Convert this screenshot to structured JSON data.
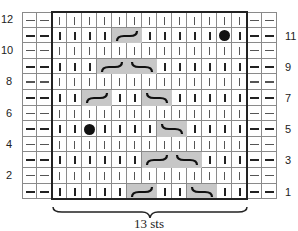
{
  "chart": {
    "rows": 12,
    "edge_cols_left": 2,
    "edge_cols_right": 2,
    "main_cols": 13,
    "row_labels_left": [
      "12",
      "10",
      "8",
      "6",
      "4",
      "2"
    ],
    "row_labels_right": [
      "11",
      "9",
      "7",
      "5",
      "3",
      "1"
    ],
    "cables": [
      {
        "row": 11,
        "col": 5,
        "type": "right-cross"
      },
      {
        "row": 9,
        "col": 4,
        "type": "right-cross"
      },
      {
        "row": 9,
        "col": 6,
        "type": "left-cross"
      },
      {
        "row": 7,
        "col": 3,
        "type": "right-cross"
      },
      {
        "row": 7,
        "col": 7,
        "type": "left-cross"
      },
      {
        "row": 5,
        "col": 8,
        "type": "left-cross"
      },
      {
        "row": 3,
        "col": 7,
        "type": "right-cross"
      },
      {
        "row": 3,
        "col": 9,
        "type": "left-cross"
      },
      {
        "row": 1,
        "col": 6,
        "type": "right-cross"
      },
      {
        "row": 1,
        "col": 10,
        "type": "left-cross"
      }
    ],
    "bobbles": [
      {
        "row": 11,
        "col": 12
      },
      {
        "row": 5,
        "col": 3
      }
    ],
    "cable_fill": "#c7c7c7",
    "repeat_label": "13 sts"
  }
}
